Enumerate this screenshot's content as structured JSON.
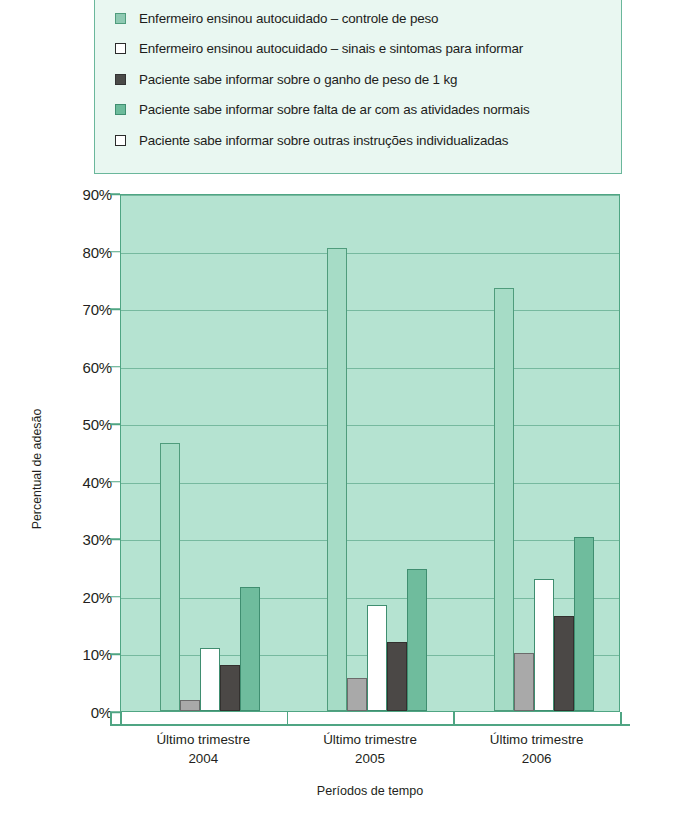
{
  "legend": {
    "items": [
      {
        "label": "Enfermeiro ensinou autocuidado – controle de peso",
        "swatch": "legend-swatch-light-green",
        "color": "#8ec9b2",
        "border": "#4f9c7c"
      },
      {
        "label": "Enfermeiro ensinou autocuidado – sinais e sintomas para informar",
        "swatch": "legend-swatch-white",
        "color": "#ffffff",
        "border": "#2b2b2b"
      },
      {
        "label": "Paciente sabe informar sobre o ganho de peso de 1 kg",
        "swatch": "legend-swatch-dark-gray",
        "color": "#4a4a48",
        "border": "#333333"
      },
      {
        "label": "Paciente sabe informar sobre falta de ar com as atividades normais",
        "swatch": "legend-swatch-green",
        "color": "#6cbb9b",
        "border": "#3f8e70"
      },
      {
        "label": "Paciente sabe informar sobre outras instruções individualizadas",
        "swatch": "legend-swatch-white-2",
        "color": "#ffffff",
        "border": "#2b2b2b"
      }
    ]
  },
  "chart_data": {
    "type": "bar",
    "title": "",
    "xlabel": "Períodos de tempo",
    "ylabel": "Percentual de adesão",
    "ylim": [
      0,
      90
    ],
    "ytick_labels": [
      "0%",
      "10%",
      "20%",
      "30%",
      "40%",
      "50%",
      "60%",
      "70%",
      "80%",
      "90%"
    ],
    "ytick_values": [
      0,
      10,
      20,
      30,
      40,
      50,
      60,
      70,
      80,
      90
    ],
    "grid": true,
    "legend_position": "top",
    "categories": [
      "Último trimestre\n2004",
      "Último trimestre\n2005",
      "Último trimestre\n2006"
    ],
    "category_lines": [
      {
        "line1": "Último trimestre",
        "line2": "2004"
      },
      {
        "line1": "Último trimestre",
        "line2": "2005"
      },
      {
        "line1": "Último trimestre",
        "line2": "2006"
      }
    ],
    "series": [
      {
        "name": "Enfermeiro ensinou autocuidado – controle de peso",
        "color": "#a6dcc6",
        "border": "#4f9c7c",
        "values": [
          46.5,
          80.5,
          73.5
        ]
      },
      {
        "name": "Enfermeiro ensinou autocuidado – sinais e sintomas para informar",
        "color": "#a9a9a9",
        "border": "#6b6b6b",
        "values": [
          2.0,
          5.8,
          10.0
        ]
      },
      {
        "name": "Paciente sabe informar sobre o ganho de peso de 1 kg",
        "color": "#ffffff",
        "border": "#3f8e70",
        "values": [
          11.0,
          18.5,
          23.0
        ]
      },
      {
        "name": "Paciente sabe informar sobre falta de ar com as atividades normais",
        "color": "#4b4846",
        "border": "#33302e",
        "values": [
          8.0,
          12.0,
          16.5
        ]
      },
      {
        "name": "Paciente sabe informar sobre outras instruções individualizadas",
        "color": "#6fbc9d",
        "border": "#3f8e70",
        "values": [
          21.5,
          24.7,
          30.2
        ]
      }
    ],
    "plot_background": "#b5e3d1",
    "axis_color": "#4fa583"
  }
}
